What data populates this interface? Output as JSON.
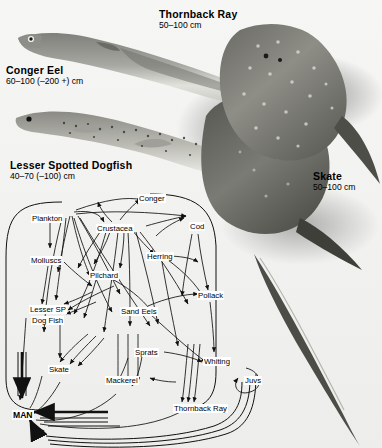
{
  "figure": {
    "background_color": "#f2f2f0",
    "line_color": "#111111"
  },
  "specimens": [
    {
      "id": "conger-eel",
      "name": "Conger Eel",
      "size": "60–100 (–200 +) cm",
      "x": 6,
      "y": 64
    },
    {
      "id": "thornback-ray",
      "name": "Thornback Ray",
      "size": "50–100 cm",
      "x": 159,
      "y": 8
    },
    {
      "id": "lesser-spotted-dogfish",
      "name": "Lesser Spotted Dogfish",
      "size": "40–70 (–100) cm",
      "x": 10,
      "y": 159
    },
    {
      "id": "skate",
      "name": "Skate",
      "size": "50–100 cm",
      "x": 313,
      "y": 170
    }
  ],
  "food_web": {
    "terminal_node": "MAN",
    "nodes": [
      {
        "id": "conger",
        "label": "Conger",
        "x": 138,
        "y": 194
      },
      {
        "id": "plankton",
        "label": "Plankton",
        "x": 31,
        "y": 214
      },
      {
        "id": "crustacea",
        "label": "Crustacea",
        "x": 96,
        "y": 224
      },
      {
        "id": "cod",
        "label": "Cod",
        "x": 189,
        "y": 222
      },
      {
        "id": "molluscs",
        "label": "Molluscs",
        "x": 30,
        "y": 256
      },
      {
        "id": "herring",
        "label": "Herring",
        "x": 146,
        "y": 252
      },
      {
        "id": "pilchard",
        "label": "Pilchard",
        "x": 89,
        "y": 271
      },
      {
        "id": "pollack",
        "label": "Pollack",
        "x": 197,
        "y": 291
      },
      {
        "id": "lesser-sp",
        "label": "Lesser SP",
        "x": 29,
        "y": 305
      },
      {
        "id": "dog-fish",
        "label": "Dog Fish",
        "x": 31,
        "y": 316
      },
      {
        "id": "sand-eels",
        "label": "Sand Eels",
        "x": 120,
        "y": 307
      },
      {
        "id": "sprats",
        "label": "Sprats",
        "x": 134,
        "y": 348
      },
      {
        "id": "whiting",
        "label": "Whiting",
        "x": 203,
        "y": 357
      },
      {
        "id": "skate-node",
        "label": "Skate",
        "x": 48,
        "y": 365
      },
      {
        "id": "mackerel",
        "label": "Mackerel",
        "x": 105,
        "y": 376
      },
      {
        "id": "juvs",
        "label": "Juvs",
        "x": 244,
        "y": 376
      },
      {
        "id": "thornback-ray-node",
        "label": "Thornback Ray",
        "x": 173,
        "y": 404
      },
      {
        "id": "man",
        "label": "MAN",
        "x": 12,
        "y": 410
      }
    ],
    "node_count": 18,
    "arrow_direction_note": "arrowheads point toward the consumer (energy flow)"
  }
}
